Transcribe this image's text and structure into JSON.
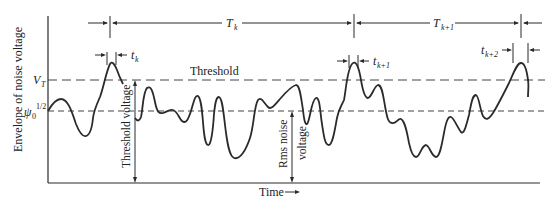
{
  "figure": {
    "y_axis_label": "Envelope of noise voltage",
    "x_axis_label": "Time",
    "x_axis_arrow": "→",
    "threshold_label": "Threshold",
    "threshold_level_label": "V",
    "threshold_level_sub": "T",
    "rms_level_label": "ψ",
    "rms_level_sub": "0",
    "rms_level_sup": "1/2",
    "threshold_voltage_label": "Threshold voltage",
    "rms_noise_label_line1": "Rms noise",
    "rms_noise_label_line2": "voltage",
    "intervals": [
      {
        "label": "T",
        "sub": "k"
      },
      {
        "label": "T",
        "sub": "k+1"
      }
    ],
    "durations": [
      {
        "label": "t",
        "sub": "k"
      },
      {
        "label": "t",
        "sub": "k+1"
      },
      {
        "label": "t",
        "sub": "k+2"
      }
    ],
    "colors": {
      "line": "#2b2b2b",
      "background": "#ffffff"
    }
  }
}
